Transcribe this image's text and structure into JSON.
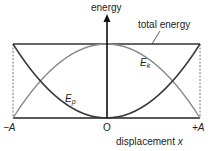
{
  "diagram": {
    "y_axis_label": "energy",
    "x_axis_label_text": "displacement",
    "x_axis_label_var": "x",
    "total_label": "total energy",
    "ek_label": "E",
    "ek_sub": "k",
    "ep_label": "E",
    "ep_sub": "p",
    "tick_left": "−A",
    "tick_origin": "O",
    "tick_right": "+A",
    "colors": {
      "axis": "#111111",
      "total": "#333333",
      "ep": "#3a3a3a",
      "ek": "#8a8a8a"
    }
  }
}
